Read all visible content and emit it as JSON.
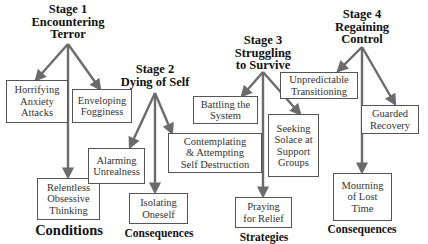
{
  "diagram": {
    "colors": {
      "arrow": "#6b6b6b",
      "box_border": "#555555",
      "text": "#111111"
    },
    "stages": [
      {
        "title_lines": [
          "Stage 1",
          "Encountering",
          "Terror"
        ],
        "category": "Conditions",
        "items": [
          {
            "lines": [
              "Horrifying",
              "Anxiety",
              "Attacks"
            ]
          },
          {
            "lines": [
              "Enveloping",
              "Fogginess"
            ]
          },
          {
            "lines": [
              "Relentless",
              "Obsessive",
              "Thinking"
            ]
          }
        ]
      },
      {
        "title_lines": [
          "Stage 2",
          "Dying of Self"
        ],
        "category": "Consequences",
        "items": [
          {
            "lines": [
              "Alarming",
              "Unrealness"
            ]
          },
          {
            "lines": [
              "Contemplating",
              "& Attempting",
              "Self Destruction"
            ]
          },
          {
            "lines": [
              "Isolating",
              "Oneself"
            ]
          }
        ]
      },
      {
        "title_lines": [
          "Stage 3",
          "Struggling",
          "to Survive"
        ],
        "category": "Strategies",
        "items": [
          {
            "lines": [
              "Battling the",
              "System"
            ]
          },
          {
            "lines": [
              "Seeking",
              "Solace at",
              "Support",
              "Groups"
            ]
          },
          {
            "lines": [
              "Praying",
              "for Relief"
            ]
          }
        ]
      },
      {
        "title_lines": [
          "Stage 4",
          "Regaining",
          "Control"
        ],
        "category": "Consequences",
        "items": [
          {
            "lines": [
              "Unpredictable",
              "Transitioning"
            ]
          },
          {
            "lines": [
              "Guarded",
              "Recovery"
            ]
          },
          {
            "lines": [
              "Mourning",
              "of Lost",
              "Time"
            ]
          }
        ]
      }
    ]
  }
}
